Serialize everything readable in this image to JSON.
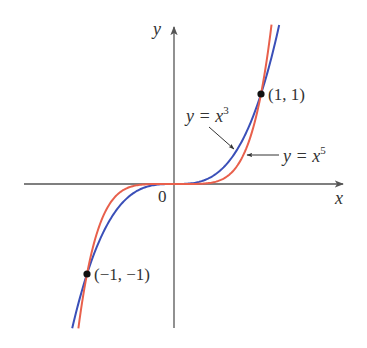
{
  "chart_data": {
    "type": "line",
    "title": "",
    "xlabel": "x",
    "ylabel": "y",
    "origin_label": "0",
    "xlim": [
      -1.73,
      1.96
    ],
    "ylim": [
      -1.6,
      1.77
    ],
    "grid": false,
    "legend": "none",
    "series": [
      {
        "name": "y = x^3",
        "label_base": "y = x",
        "label_exp": "3",
        "exponent": 3,
        "color": "#3a4fb8",
        "x_range": [
          -1.17,
          1.209
        ]
      },
      {
        "name": "y = x^5",
        "label_base": "y = x",
        "label_exp": "5",
        "exponent": 5,
        "color": "#e8604c",
        "x_range": [
          -1.099,
          1.121
        ]
      }
    ],
    "points": [
      {
        "x": 1,
        "y": 1,
        "label": "(1, 1)"
      },
      {
        "x": -1,
        "y": -1,
        "label": "(−1, −1)"
      }
    ],
    "annotations": [
      {
        "text": "y = x^3",
        "points_to": "y = x^3 curve"
      },
      {
        "text": "y = x^5",
        "points_to": "y = x^5 curve"
      }
    ]
  },
  "colors": {
    "axis": "#555555",
    "text": "#333333",
    "point": "#111111"
  }
}
